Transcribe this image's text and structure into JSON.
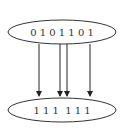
{
  "diagram": {
    "top_node": {
      "label": "0 1 0 1 1 0 1"
    },
    "bottom_node": {
      "label": "1 1 1  1 1 1"
    },
    "edges": [
      {
        "from": "top_node",
        "to": "bottom_node",
        "x": 39
      },
      {
        "from": "top_node",
        "to": "bottom_node",
        "x": 60
      },
      {
        "from": "top_node",
        "to": "bottom_node",
        "x": 67
      },
      {
        "from": "top_node",
        "to": "bottom_node",
        "x": 90
      }
    ],
    "colors": {
      "stroke": "#333333",
      "background": "#ffffff"
    }
  }
}
